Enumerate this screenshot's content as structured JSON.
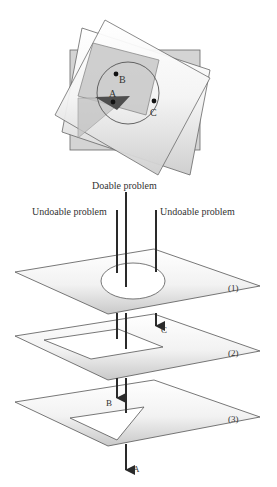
{
  "top_figure": {
    "points": [
      {
        "id": "B",
        "label": "B"
      },
      {
        "id": "A",
        "label": "A"
      },
      {
        "id": "C",
        "label": "C"
      }
    ]
  },
  "labels": {
    "doable": "Doable problem",
    "undoable_left": "Undoable problem",
    "undoable_right": "Undoable problem"
  },
  "layers": [
    {
      "id": "1",
      "label": "(1)",
      "hole_shape": "ellipse"
    },
    {
      "id": "2",
      "label": "(2)",
      "hole_shape": "rectangle"
    },
    {
      "id": "3",
      "label": "(3)",
      "hole_shape": "triangle"
    }
  ],
  "arrows": [
    {
      "id": "C",
      "label": "C",
      "exits_after_layer": "1"
    },
    {
      "id": "B",
      "label": "B",
      "exits_after_layer": "2"
    },
    {
      "id": "A",
      "label": "A",
      "exits_after_layer": "3"
    }
  ],
  "colors": {
    "stroke": "#555555",
    "plane_fill_light": "#ffffff",
    "plane_fill_dark": "#cfcfcf",
    "shaded_rect": "#c8c8c8",
    "dark_triangle": "#5a5a5a",
    "line": "#2a2a2a"
  }
}
